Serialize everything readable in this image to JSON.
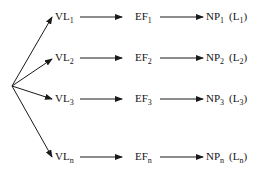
{
  "diagram": {
    "origin": {
      "x": 12,
      "y": 86
    },
    "rows": [
      {
        "y": 17,
        "vl": {
          "base": "VL",
          "sub": "1"
        },
        "ef": {
          "base": "EF",
          "sub": "1"
        },
        "np": {
          "base": "NP",
          "sub": "1"
        },
        "l": {
          "open": "(",
          "base": "L",
          "sub": "1",
          "close": ")"
        }
      },
      {
        "y": 58,
        "vl": {
          "base": "VL",
          "sub": "2"
        },
        "ef": {
          "base": "EF",
          "sub": "2"
        },
        "np": {
          "base": "NP",
          "sub": "2"
        },
        "l": {
          "open": "(",
          "base": "L",
          "sub": "2",
          "close": ")"
        }
      },
      {
        "y": 99,
        "vl": {
          "base": "VL",
          "sub": "3"
        },
        "ef": {
          "base": "EF",
          "sub": "3"
        },
        "np": {
          "base": "NP",
          "sub": "3"
        },
        "l": {
          "open": "(",
          "base": "L",
          "sub": "3",
          "close": ")"
        }
      },
      {
        "y": 157,
        "vl": {
          "base": "VL",
          "sub": "n"
        },
        "ef": {
          "base": "EF",
          "sub": "n"
        },
        "np": {
          "base": "NP",
          "sub": "n"
        },
        "l": {
          "open": "(",
          "base": "L",
          "sub": "n",
          "close": ")"
        }
      }
    ],
    "line_color": "#1a1a1a"
  }
}
